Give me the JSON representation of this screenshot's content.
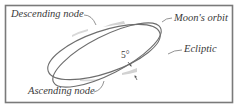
{
  "diagram": {
    "labels": {
      "descending_node": "Descending node",
      "moons_orbit": "Moon's orbit",
      "ecliptic": "Ecliptic",
      "ascending_node": "Ascending node",
      "angle": "5°"
    },
    "elements": {
      "frame": {
        "x": 5,
        "y": 5,
        "width": 228,
        "height": 98
      },
      "moons_orbit_ellipse": {
        "cx": 104,
        "cy": 52,
        "rx": 59,
        "ry": 21,
        "rotation_deg": -19
      },
      "ecliptic_ellipse": {
        "cx": 107,
        "cy": 55,
        "rx": 60,
        "ry": 19,
        "rotation_deg": -27
      },
      "descending_node_point": {
        "x": 97,
        "y": 27
      },
      "ascending_node_point": {
        "x": 104,
        "y": 79
      },
      "inclination_deg": 5
    },
    "colors": {
      "line": "#707070",
      "frame": "#7a7a7a",
      "shade": "#d4d4d4",
      "text": "#3a3a3a",
      "background": "#ffffff"
    }
  }
}
